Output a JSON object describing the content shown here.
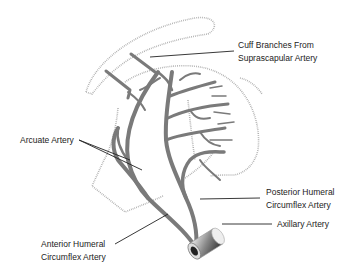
{
  "figure": {
    "type": "anatomical-diagram"
  },
  "labels": {
    "cuff_branches": [
      "Cuff Branches From",
      "Suprascapular Artery"
    ],
    "arcuate": "Arcuate Artery",
    "posterior_humeral": [
      "Posterior Humeral",
      "Circumflex Artery"
    ],
    "axillary": "Axillary Artery",
    "anterior_humeral": [
      "Anterior Humeral",
      "Circumflex Artery"
    ]
  },
  "colors": {
    "artery": "#7a7a7a",
    "outline": "#aaaaaa",
    "leader_line": "#222222",
    "text": "#222222"
  }
}
